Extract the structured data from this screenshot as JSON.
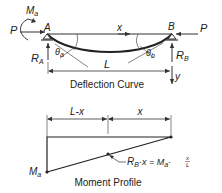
{
  "deflection": {
    "caption": "Deflection Curve",
    "load_left": "P",
    "load_right": "P",
    "moment_label": "M",
    "moment_sub": "a",
    "support_a": "A",
    "support_b": "B",
    "reaction_a": "R",
    "reaction_a_sub": "A",
    "reaction_b": "R",
    "reaction_b_sub": "B",
    "angle_a": "θ",
    "angle_a_sub": "a",
    "angle_b": "θ",
    "angle_b_sub": "b",
    "span_label": "L",
    "x_axis_label": "x",
    "y_axis_label": "y"
  },
  "moment": {
    "caption": "Moment Profile",
    "dim_left": "L-x",
    "dim_right": "x",
    "end_label": "M",
    "end_sub": "a",
    "eq_r": "R",
    "eq_r_sub": "B",
    "eq_mid": "·x = M",
    "eq_m_sub": "a",
    "eq_frac_num": "x",
    "eq_frac_den": "L"
  },
  "colors": {
    "line": "#333333",
    "text": "#222222",
    "background": "#ffffff"
  }
}
